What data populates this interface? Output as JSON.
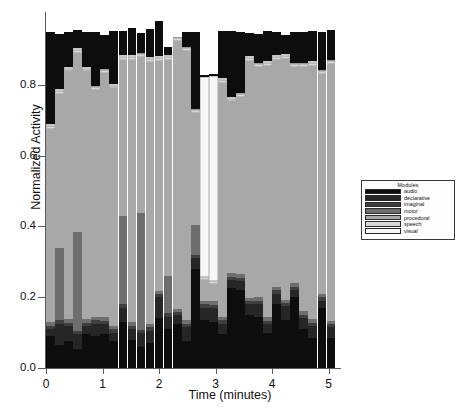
{
  "chart_data": {
    "type": "bar",
    "stacked": true,
    "title": "",
    "xlabel": "Time (minutes)",
    "ylabel": "Normalized Activity",
    "xlim": [
      0,
      5.2
    ],
    "ylim": [
      0.0,
      1.0
    ],
    "xticks": [
      0,
      1,
      2,
      3,
      4,
      5
    ],
    "xtick_labels": [
      "0",
      "1",
      "2",
      "3",
      "4",
      "5"
    ],
    "yticks": [
      0.0,
      0.2,
      0.4,
      0.6,
      0.8
    ],
    "ytick_labels": [
      "0.0",
      "0.2",
      "0.4",
      "0.6",
      "0.8"
    ],
    "grid": false,
    "legend_position": "right",
    "legend_title": "Modules",
    "series": [
      {
        "name": "audio",
        "color": "#0d0d0d",
        "values": [
          0.09,
          0.065,
          0.075,
          0.055,
          0.095,
          0.09,
          0.095,
          0.075,
          0.13,
          0.08,
          0.06,
          0.07,
          0.14,
          0.11,
          0.125,
          0.075,
          0.28,
          0.135,
          0.13,
          0.095,
          0.225,
          0.22,
          0.15,
          0.145,
          0.1,
          0.18,
          0.135,
          0.2,
          0.11,
          0.085,
          0.17,
          0.085
        ]
      },
      {
        "name": "declarative",
        "color": "#262626",
        "values": [
          0.02,
          0.06,
          0.045,
          0.04,
          0.025,
          0.035,
          0.03,
          0.025,
          0.04,
          0.03,
          0.04,
          0.035,
          0.06,
          0.035,
          0.025,
          0.04,
          0.03,
          0.035,
          0.04,
          0.03,
          0.025,
          0.025,
          0.03,
          0.035,
          0.025,
          0.03,
          0.04,
          0.02,
          0.03,
          0.035,
          0.02,
          0.03
        ]
      },
      {
        "name": "imaginal",
        "color": "#3f3f3f",
        "values": [
          0.01,
          0.01,
          0.008,
          0.01,
          0.008,
          0.01,
          0.008,
          0.01,
          0.01,
          0.01,
          0.008,
          0.01,
          0.008,
          0.01,
          0.008,
          0.01,
          0.01,
          0.01,
          0.008,
          0.01,
          0.008,
          0.01,
          0.008,
          0.01,
          0.008,
          0.01,
          0.008,
          0.01,
          0.01,
          0.008,
          0.01,
          0.008
        ]
      },
      {
        "name": "motor",
        "color": "#6e6e6e",
        "values": [
          0.01,
          0.205,
          0.01,
          0.28,
          0.01,
          0.01,
          0.01,
          0.01,
          0.25,
          0.01,
          0.33,
          0.01,
          0.01,
          0.105,
          0.01,
          0.01,
          0.085,
          0.01,
          0.01,
          0.01,
          0.01,
          0.01,
          0.01,
          0.01,
          0.01,
          0.01,
          0.01,
          0.01,
          0.01,
          0.01,
          0.01,
          0.01
        ]
      },
      {
        "name": "procedural",
        "color": "#a8a8a8",
        "values": [
          0.545,
          0.435,
          0.7,
          0.505,
          0.7,
          0.64,
          0.69,
          0.67,
          0.44,
          0.74,
          0.44,
          0.74,
          0.65,
          0.61,
          0.755,
          0.76,
          0.315,
          0.06,
          0.05,
          0.66,
          0.485,
          0.5,
          0.67,
          0.65,
          0.71,
          0.64,
          0.68,
          0.61,
          0.69,
          0.715,
          0.62,
          0.725
        ]
      },
      {
        "name": "speech",
        "color": "#d8d8d8",
        "values": [
          0.008,
          0.008,
          0.008,
          0.008,
          0.008,
          0.008,
          0.008,
          0.008,
          0.008,
          0.008,
          0.008,
          0.008,
          0.008,
          0.008,
          0.008,
          0.008,
          0.008,
          0.008,
          0.008,
          0.008,
          0.008,
          0.008,
          0.008,
          0.008,
          0.008,
          0.008,
          0.008,
          0.008,
          0.008,
          0.008,
          0.008,
          0.008
        ]
      },
      {
        "name": "visual",
        "color": "#f7f7f7",
        "values": [
          0.005,
          0.005,
          0.005,
          0.005,
          0.005,
          0.005,
          0.005,
          0.005,
          0.005,
          0.005,
          0.005,
          0.005,
          0.005,
          0.005,
          0.005,
          0.005,
          0.005,
          0.565,
          0.58,
          0.005,
          0.005,
          0.005,
          0.005,
          0.005,
          0.005,
          0.005,
          0.005,
          0.005,
          0.005,
          0.005,
          0.005,
          0.005
        ]
      },
      {
        "name": "cap",
        "color": "#0d0d0d",
        "values": [
          0.262,
          0.157,
          0.099,
          0.052,
          0.098,
          0.152,
          0.095,
          0.15,
          0.07,
          0.077,
          0.056,
          0.08,
          0.098,
          0.025,
          0.0,
          0.04,
          0.215,
          0.005,
          0.005,
          0.135,
          0.185,
          0.17,
          0.065,
          0.08,
          0.085,
          0.065,
          0.055,
          0.085,
          0.085,
          0.085,
          0.105,
          0.085
        ]
      }
    ],
    "x": [
      0.08,
      0.24,
      0.4,
      0.56,
      0.72,
      0.88,
      1.04,
      1.2,
      1.36,
      1.52,
      1.68,
      1.84,
      2.0,
      2.16,
      2.32,
      2.48,
      2.64,
      2.8,
      2.96,
      3.12,
      3.28,
      3.44,
      3.6,
      3.76,
      3.92,
      4.08,
      4.24,
      4.4,
      4.56,
      4.72,
      4.88,
      5.04
    ],
    "totals": [
      0.95,
      0.945,
      0.95,
      0.955,
      0.944,
      0.945,
      0.936,
      0.948,
      0.953,
      0.96,
      0.942,
      0.958,
      0.979,
      0.908,
      0.936,
      0.94,
      0.948,
      0.828,
      0.828,
      0.955,
      0.951,
      0.948,
      0.946,
      0.935,
      0.951,
      0.938,
      0.933,
      0.948,
      0.948,
      0.951,
      0.948,
      0.948
    ],
    "n_bars": 32
  },
  "legend": {
    "title": "Modules",
    "items": [
      {
        "label": "audio",
        "color": "#0d0d0d"
      },
      {
        "label": "declarative",
        "color": "#262626"
      },
      {
        "label": "imaginal",
        "color": "#3f3f3f"
      },
      {
        "label": "motor",
        "color": "#6e6e6e"
      },
      {
        "label": "procedural",
        "color": "#a8a8a8"
      },
      {
        "label": "speech",
        "color": "#d8d8d8"
      },
      {
        "label": "visual",
        "color": "#f7f7f7"
      }
    ]
  },
  "axes": {
    "y_title": "Normalized Activity",
    "x_title": "Time (minutes)"
  }
}
